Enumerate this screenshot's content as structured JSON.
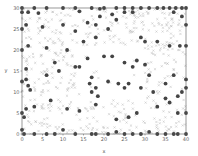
{
  "chart_data": {
    "type": "scatter",
    "title": "",
    "xlabel": "x",
    "ylabel": "y",
    "xlim": [
      0,
      40
    ],
    "ylim": [
      0,
      30
    ],
    "x_ticks": [
      0,
      5,
      10,
      15,
      20,
      25,
      30,
      35,
      40
    ],
    "y_ticks": [
      0,
      5,
      10,
      15,
      20,
      25,
      30
    ],
    "grid": false,
    "legend": null,
    "colors": {
      "dots": "#444444",
      "crosses": "#b8b8b8",
      "axis": "#555555"
    },
    "series": [
      {
        "name": "dots",
        "marker": "circle",
        "points": [
          [
            0,
            30
          ],
          [
            3,
            30
          ],
          [
            6,
            30
          ],
          [
            10,
            30
          ],
          [
            13,
            30
          ],
          [
            17,
            30
          ],
          [
            19,
            29.8
          ],
          [
            20,
            30
          ],
          [
            23,
            30
          ],
          [
            25,
            30
          ],
          [
            27,
            30
          ],
          [
            29,
            30
          ],
          [
            31,
            30
          ],
          [
            33,
            30
          ],
          [
            34.5,
            30
          ],
          [
            36,
            30
          ],
          [
            37.5,
            30
          ],
          [
            39,
            30
          ],
          [
            40,
            30
          ],
          [
            0,
            29
          ],
          [
            1.5,
            29
          ],
          [
            4,
            28.8
          ],
          [
            14,
            29.2
          ],
          [
            19,
            28
          ],
          [
            22,
            28.5
          ],
          [
            25,
            29
          ],
          [
            27,
            29
          ],
          [
            37,
            29
          ],
          [
            39,
            28
          ],
          [
            0,
            25
          ],
          [
            1,
            26
          ],
          [
            5,
            25.5
          ],
          [
            10,
            26
          ],
          [
            13,
            24.5
          ],
          [
            16,
            26.5
          ],
          [
            18,
            26
          ],
          [
            21,
            25
          ],
          [
            23,
            27.2
          ],
          [
            40,
            26
          ],
          [
            0,
            20
          ],
          [
            1.5,
            21
          ],
          [
            6,
            20.5
          ],
          [
            11,
            20
          ],
          [
            15,
            22
          ],
          [
            18,
            23
          ],
          [
            29,
            23
          ],
          [
            30,
            22
          ],
          [
            33,
            22
          ],
          [
            36,
            21
          ],
          [
            38.5,
            21
          ],
          [
            40,
            21
          ],
          [
            8,
            17
          ],
          [
            13,
            16
          ],
          [
            16,
            18
          ],
          [
            20,
            18.5
          ],
          [
            22,
            18.5
          ],
          [
            25,
            17
          ],
          [
            27,
            16
          ],
          [
            28,
            17.5
          ],
          [
            30,
            16.5
          ],
          [
            31,
            14
          ],
          [
            35,
            12
          ],
          [
            37,
            14
          ],
          [
            40,
            13
          ],
          [
            0,
            12.5
          ],
          [
            1,
            13
          ],
          [
            1.5,
            11.5
          ],
          [
            2,
            10.5
          ],
          [
            16.5,
            12
          ],
          [
            18,
            11
          ],
          [
            17,
            10
          ],
          [
            18.5,
            9
          ],
          [
            21,
            12.5
          ],
          [
            23.5,
            12
          ],
          [
            25,
            11
          ],
          [
            26,
            12
          ],
          [
            29,
            11
          ],
          [
            32,
            10
          ],
          [
            35,
            8.5
          ],
          [
            38,
            9
          ],
          [
            39,
            10
          ],
          [
            40,
            11
          ],
          [
            1,
            15.5
          ],
          [
            6,
            14
          ],
          [
            9,
            15
          ],
          [
            14,
            16
          ],
          [
            17,
            13.5
          ],
          [
            0,
            5
          ],
          [
            0.5,
            4
          ],
          [
            1,
            6
          ],
          [
            3,
            6.5
          ],
          [
            7,
            8
          ],
          [
            11,
            6
          ],
          [
            14,
            5.5
          ],
          [
            18,
            7
          ],
          [
            23,
            3.5
          ],
          [
            26,
            4
          ],
          [
            28,
            5
          ],
          [
            33,
            6.5
          ],
          [
            36,
            7.5
          ],
          [
            38,
            5
          ],
          [
            40,
            5
          ],
          [
            0,
            1
          ],
          [
            0.5,
            0
          ],
          [
            3,
            0
          ],
          [
            6,
            0
          ],
          [
            8,
            0
          ],
          [
            10,
            1
          ],
          [
            13,
            0
          ],
          [
            17,
            0
          ],
          [
            18,
            0
          ],
          [
            21,
            0
          ],
          [
            23,
            0.5
          ],
          [
            25,
            0
          ],
          [
            27,
            0
          ],
          [
            29,
            0
          ],
          [
            31,
            0.5
          ],
          [
            33,
            0
          ],
          [
            35,
            0
          ],
          [
            37,
            0
          ],
          [
            38,
            0
          ],
          [
            40,
            0
          ]
        ]
      },
      {
        "name": "crosses",
        "marker": "x",
        "generated": {
          "count": 520,
          "seed": 7,
          "exclude_region": {
            "x": [
              14,
              30
            ],
            "y": [
              8,
              21
            ]
          }
        }
      }
    ]
  }
}
